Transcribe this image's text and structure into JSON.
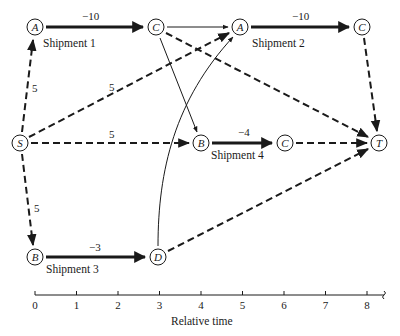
{
  "diagram": {
    "nodes": {
      "A1": {
        "label": "A",
        "x": 35,
        "y": 27
      },
      "C1": {
        "label": "C",
        "x": 156,
        "y": 27
      },
      "A2": {
        "label": "A",
        "x": 240,
        "y": 27
      },
      "C2": {
        "label": "C",
        "x": 362,
        "y": 27
      },
      "S": {
        "label": "S",
        "x": 20,
        "y": 143
      },
      "B4": {
        "label": "B",
        "x": 201,
        "y": 143
      },
      "C4": {
        "label": "C",
        "x": 285,
        "y": 143
      },
      "T": {
        "label": "T",
        "x": 379,
        "y": 143
      },
      "B3": {
        "label": "B",
        "x": 35,
        "y": 257
      },
      "D3": {
        "label": "D",
        "x": 158,
        "y": 257
      }
    },
    "shipments": [
      {
        "name": "Shipment 1",
        "from": "A",
        "to": "C",
        "weight": "−10"
      },
      {
        "name": "Shipment 2",
        "from": "A",
        "to": "C",
        "weight": "−10"
      },
      {
        "name": "Shipment 3",
        "from": "B",
        "to": "D",
        "weight": "−3"
      },
      {
        "name": "Shipment 4",
        "from": "B",
        "to": "C",
        "weight": "−4"
      }
    ],
    "source_edges": [
      {
        "from": "S",
        "to": "A (Shipment 1)",
        "weight": "5"
      },
      {
        "from": "S",
        "to": "A (Shipment 2)",
        "weight": "5"
      },
      {
        "from": "S",
        "to": "B (Shipment 4)",
        "weight": "5"
      },
      {
        "from": "S",
        "to": "B (Shipment 3)",
        "weight": "5"
      }
    ],
    "sink_edges": [
      {
        "from": "C (Shipment 1)",
        "to": "T"
      },
      {
        "from": "C (Shipment 2)",
        "to": "T"
      },
      {
        "from": "C (Shipment 4)",
        "to": "T"
      },
      {
        "from": "D (Shipment 3)",
        "to": "T"
      }
    ],
    "precedence_edges": [
      {
        "from": "C (Shipment 1)",
        "to": "A (Shipment 2)"
      },
      {
        "from": "C (Shipment 1)",
        "to": "B (Shipment 4)"
      },
      {
        "from": "D (Shipment 3)",
        "to": "A (Shipment 2)"
      }
    ],
    "axis": {
      "title": "Relative time",
      "ticks": [
        "0",
        "1",
        "2",
        "3",
        "4",
        "5",
        "6",
        "7",
        "8"
      ]
    },
    "legend_text": {
      "edge_5": "5",
      "w_minus10": "−10",
      "w_minus3": "−3",
      "w_minus4": "−4"
    }
  }
}
